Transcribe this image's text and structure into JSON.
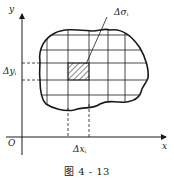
{
  "figure": {
    "caption": "图 4 - 13",
    "colors": {
      "ink": "#1a1a1a",
      "background": "#ffffff"
    }
  },
  "axes": {
    "x_label": "x",
    "y_label": "y",
    "origin_label": "O"
  },
  "annotations": {
    "delta_sigma": {
      "symbol": "Δσ",
      "subscript": "i"
    },
    "delta_x": {
      "symbol": "Δx",
      "subscript": "i"
    },
    "delta_y": {
      "symbol": "Δy",
      "subscript": "i"
    }
  },
  "region": {
    "description": "closed region D partitioned by grid into small cells",
    "grid_vertical_x": [
      47,
      68,
      89,
      108,
      125
    ],
    "grid_horizontal_y": [
      35,
      50,
      63,
      80,
      95
    ],
    "highlighted_cell": {
      "x1": 68,
      "x2": 89,
      "y1": 63,
      "y2": 80,
      "fill": "hatched"
    }
  }
}
